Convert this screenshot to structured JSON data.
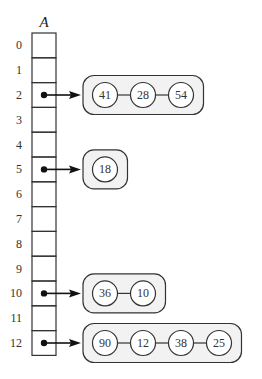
{
  "diagram": {
    "array_name": "A",
    "slot_count": 13,
    "indices": [
      "0",
      "1",
      "2",
      "3",
      "4",
      "5",
      "6",
      "7",
      "8",
      "9",
      "10",
      "11",
      "12"
    ],
    "chains": [
      {
        "slot": 2,
        "values": [
          "41",
          "28",
          "54"
        ]
      },
      {
        "slot": 5,
        "values": [
          "18"
        ]
      },
      {
        "slot": 10,
        "values": [
          "36",
          "10"
        ]
      },
      {
        "slot": 12,
        "values": [
          "90",
          "12",
          "38",
          "25"
        ]
      }
    ],
    "colors": {
      "stroke": "#333333",
      "capsule_fill": "#f2f2f2",
      "node_fill": "#ffffff",
      "background": "#ffffff"
    }
  }
}
